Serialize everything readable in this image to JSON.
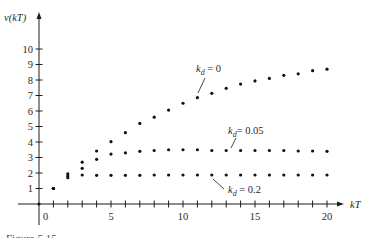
{
  "chart_data": {
    "type": "scatter",
    "title": "",
    "xlabel": "kT",
    "ylabel": "v(kT)",
    "xlim": [
      -2,
      21.5
    ],
    "ylim": [
      0,
      11.5
    ],
    "x_ticks": [
      1,
      2,
      3,
      4,
      5,
      6,
      7,
      8,
      9,
      10,
      11,
      12,
      13,
      14,
      15,
      16,
      17,
      18,
      19,
      20
    ],
    "x_tick_labels": [
      {
        "value": 0,
        "label": "0"
      },
      {
        "value": 5,
        "label": "5"
      },
      {
        "value": 10,
        "label": "10"
      },
      {
        "value": 15,
        "label": "15"
      },
      {
        "value": 20,
        "label": "20"
      }
    ],
    "y_ticks": [
      1,
      2,
      3,
      4,
      5,
      6,
      7,
      8,
      9,
      10
    ],
    "y_tick_labels": [
      "1",
      "2",
      "3",
      "4",
      "5",
      "6",
      "7",
      "8",
      "9",
      "10"
    ],
    "grid": false,
    "legend": "inline annotations with leader lines",
    "series": [
      {
        "name": "k_d = 0",
        "label_main": "k",
        "label_sub": "d",
        "label_rest": " = 0",
        "x": [
          1,
          2,
          3,
          4,
          5,
          6,
          7,
          8,
          9,
          10,
          11,
          12,
          13,
          14,
          15,
          16,
          17,
          18,
          19,
          20
        ],
        "values": [
          1.0,
          1.95,
          2.7,
          3.42,
          4.02,
          4.6,
          5.2,
          5.6,
          6.06,
          6.5,
          6.86,
          7.14,
          7.46,
          7.74,
          7.94,
          8.1,
          8.3,
          8.4,
          8.6,
          8.7
        ]
      },
      {
        "name": "k_d = 0.05",
        "label_main": "k",
        "label_sub": "d",
        "label_rest": "= 0.05",
        "x": [
          1,
          2,
          3,
          4,
          5,
          6,
          7,
          8,
          9,
          10,
          11,
          12,
          13,
          14,
          15,
          16,
          17,
          18,
          19,
          20
        ],
        "values": [
          1.0,
          1.8,
          2.3,
          2.88,
          3.22,
          3.3,
          3.4,
          3.45,
          3.5,
          3.5,
          3.5,
          3.45,
          3.45,
          3.45,
          3.45,
          3.45,
          3.45,
          3.42,
          3.42,
          3.4
        ]
      },
      {
        "name": "k_d = 0.2",
        "label_main": "k",
        "label_sub": "d",
        "label_rest": " = 0.2",
        "x": [
          1,
          2,
          3,
          4,
          5,
          6,
          7,
          8,
          9,
          10,
          11,
          12,
          13,
          14,
          15,
          16,
          17,
          18,
          19,
          20
        ],
        "values": [
          1.0,
          1.7,
          1.87,
          1.85,
          1.85,
          1.85,
          1.85,
          1.87,
          1.87,
          1.87,
          1.87,
          1.87,
          1.87,
          1.87,
          1.87,
          1.87,
          1.87,
          1.87,
          1.87,
          1.87
        ]
      }
    ],
    "caption_partial": "Figure 5.15"
  }
}
